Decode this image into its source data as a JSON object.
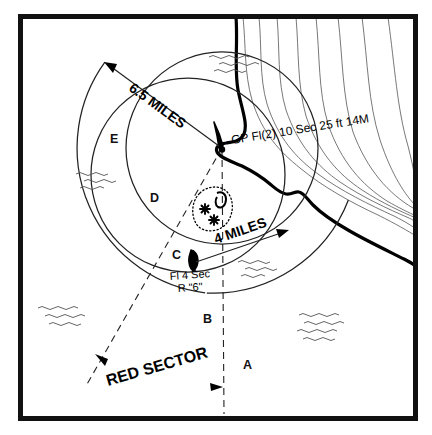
{
  "figure": {
    "type": "nautical-chart-diagram",
    "title_visible": false,
    "width": 432,
    "height": 435,
    "background_color": "#ffffff",
    "ink_color": "#000000",
    "border": {
      "name": "chart-frame",
      "stroke_color": "#000000",
      "stroke_width": 5,
      "x": 18,
      "y": 14,
      "width": 400,
      "height": 407
    }
  },
  "light": {
    "symbol_name": "lighthouse-light-symbol",
    "x": 222,
    "y": 148,
    "characteristic": "GP Fl(2)  10 Sec  25 ft 14M",
    "characteristic_parts": {
      "pattern": "GP Fl(2)",
      "period": "10 Sec",
      "height": "25 ft",
      "range": "14M"
    },
    "label_x": 232,
    "label_y": 143
  },
  "buoy": {
    "symbol_name": "red-nun-buoy-symbol",
    "x": 194,
    "y": 262,
    "label_line1": "Fl 4 Sec",
    "label_line2": "R \"6\"",
    "label_x": 196,
    "label_y1": 279,
    "label_y2": 291
  },
  "distances": [
    {
      "name": "six-point-five-miles",
      "label": "6.5 MILES",
      "value": 6.5,
      "unit": "miles",
      "from": {
        "x": 222,
        "y": 148
      },
      "to": {
        "x": 104,
        "y": 62
      },
      "label_x": 134,
      "label_y": 92,
      "rotation": -36
    },
    {
      "name": "four-miles",
      "label": "4 MILES",
      "value": 4,
      "unit": "miles",
      "from": {
        "x": 196,
        "y": 262
      },
      "to": {
        "x": 287,
        "y": 231
      },
      "label_x": 226,
      "label_y": 242,
      "rotation": -19
    }
  ],
  "arcs": [
    {
      "name": "outer-white-sector-arc",
      "description": "6.5 mile arc of white sector E",
      "cx": 222,
      "cy": 148,
      "r": 146,
      "start_deg": 144,
      "end_deg": 263,
      "stroke_width": 1.2
    },
    {
      "name": "outer-arc-lower-right",
      "description": "6.5 mile arc lower right segment",
      "cx": 222,
      "cy": 148,
      "r": 146,
      "start_deg": 30,
      "end_deg": 96,
      "stroke_width": 1.2
    }
  ],
  "circles": [
    {
      "name": "four-mile-red-sector-circle",
      "description": "4 mile range circle centred on the light",
      "cx": 222,
      "cy": 148,
      "r": 96,
      "stroke_width": 1.2
    },
    {
      "name": "inner-sector-circle",
      "description": "inner arc circle for sector B / D boundary",
      "cx": 188,
      "cy": 175,
      "r": 97,
      "stroke_width": 1.2
    }
  ],
  "sector_lines": [
    {
      "name": "sector-line-west",
      "description": "dashed bearing line to lower left",
      "x1": 222,
      "y1": 148,
      "x2": 88,
      "y2": 383
    },
    {
      "name": "sector-line-south",
      "description": "dashed bearing line running south",
      "x1": 222,
      "y1": 148,
      "x2": 224,
      "y2": 412
    }
  ],
  "sector_letters": [
    {
      "name": "sector-label-a",
      "label": "A",
      "x": 243,
      "y": 369
    },
    {
      "name": "sector-label-b",
      "label": "B",
      "x": 203,
      "y": 323
    },
    {
      "name": "sector-label-c",
      "label": "C",
      "x": 172,
      "y": 259
    },
    {
      "name": "sector-label-d",
      "label": "D",
      "x": 150,
      "y": 202
    },
    {
      "name": "sector-label-e",
      "label": "E",
      "x": 110,
      "y": 143
    }
  ],
  "red_sector": {
    "name": "red-sector-annotation",
    "label": "RED SECTOR",
    "label_x": 140,
    "label_y": 385,
    "rotation": -16,
    "arrow_left": {
      "x": 96,
      "y": 355
    },
    "arrow_right": {
      "x": 222,
      "y": 387
    }
  },
  "danger_area": {
    "name": "rocky-danger-area",
    "description": "dotted outline with rock and obstruction symbols",
    "cx": 212,
    "cy": 206,
    "rocks": [
      {
        "name": "rock-symbol",
        "x": 205,
        "y": 209
      },
      {
        "name": "rock-symbol",
        "x": 214,
        "y": 220
      }
    ],
    "obstruction": {
      "name": "obstruction-symbol",
      "x": 221,
      "y": 199
    }
  },
  "coastline": {
    "name": "coastline",
    "stroke_width": 3.2,
    "description": "heavy shoreline running from top edge down to right edge"
  },
  "contours": {
    "name": "land-contour-lines",
    "count": 8,
    "stroke_width": 0.8,
    "description": "thin topographic contour lines inland of the coast"
  },
  "wave_groups": [
    {
      "name": "wave-symbol-group",
      "x": 228,
      "y": 58,
      "rows": 3
    },
    {
      "name": "wave-symbol-group",
      "x": 87,
      "y": 178,
      "rows": 3
    },
    {
      "name": "wave-symbol-group",
      "x": 245,
      "y": 265,
      "rows": 3
    },
    {
      "name": "wave-symbol-group",
      "x": 47,
      "y": 312,
      "rows": 3
    },
    {
      "name": "wave-symbol-group",
      "x": 305,
      "y": 320,
      "rows": 4
    }
  ]
}
